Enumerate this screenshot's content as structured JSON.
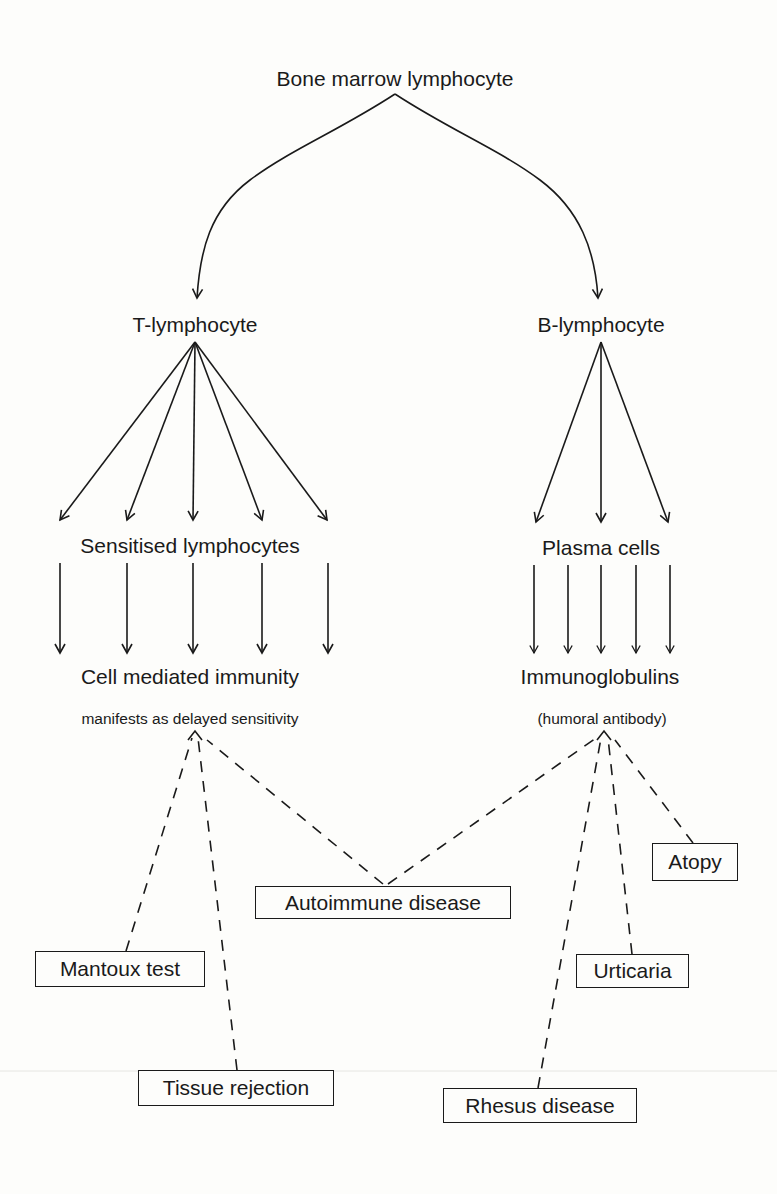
{
  "diagram": {
    "colors": {
      "ink": "#1a1a1a",
      "paper": "#fdfdfb"
    },
    "nodes": {
      "root": "Bone marrow lymphocyte",
      "t_cell": "T-lymphocyte",
      "b_cell": "B-lymphocyte",
      "sensitised": "Sensitised lymphocytes",
      "plasma": "Plasma cells",
      "cmi": "Cell mediated immunity",
      "cmi_note": "manifests as delayed sensitivity",
      "ig": "Immunoglobulins",
      "ig_note": "(humoral antibody)"
    },
    "outcomes": [
      {
        "id": "mantoux",
        "label": "Mantoux test",
        "source": "cell-mediated"
      },
      {
        "id": "tissue",
        "label": "Tissue rejection",
        "source": "cell-mediated"
      },
      {
        "id": "autoimmune",
        "label": "Autoimmune disease",
        "source": "both"
      },
      {
        "id": "atopy",
        "label": "Atopy",
        "source": "humoral"
      },
      {
        "id": "urticaria",
        "label": "Urticaria",
        "source": "humoral"
      },
      {
        "id": "rhesus",
        "label": "Rhesus disease",
        "source": "humoral"
      }
    ],
    "edges": [
      {
        "from": "root",
        "to": "t_cell",
        "style": "solid"
      },
      {
        "from": "root",
        "to": "b_cell",
        "style": "solid"
      },
      {
        "from": "t_cell",
        "to": "sensitised",
        "style": "solid",
        "count": 5
      },
      {
        "from": "sensitised",
        "to": "cmi",
        "style": "solid",
        "count": 5
      },
      {
        "from": "b_cell",
        "to": "plasma",
        "style": "solid",
        "count": 3
      },
      {
        "from": "plasma",
        "to": "ig",
        "style": "solid",
        "count": 5
      },
      {
        "from": "mantoux",
        "to": "cmi",
        "style": "dashed"
      },
      {
        "from": "tissue",
        "to": "cmi",
        "style": "dashed"
      },
      {
        "from": "autoimmune",
        "to": "cmi",
        "style": "dashed"
      },
      {
        "from": "autoimmune",
        "to": "ig",
        "style": "dashed"
      },
      {
        "from": "rhesus",
        "to": "ig",
        "style": "dashed"
      },
      {
        "from": "urticaria",
        "to": "ig",
        "style": "dashed"
      },
      {
        "from": "atopy",
        "to": "ig",
        "style": "dashed"
      }
    ]
  }
}
